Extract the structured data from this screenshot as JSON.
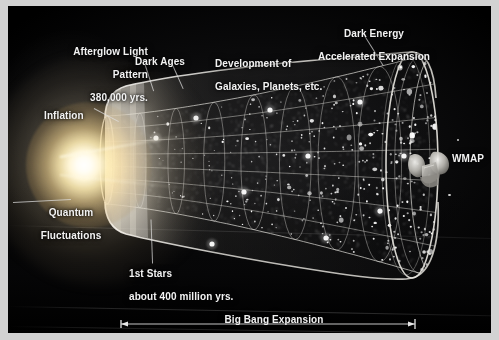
{
  "figure": {
    "kind": "cosmic-timeline-diagram",
    "background_color": "#000000",
    "frame_color": "#d2d2d2",
    "text_color": "#f2f2f2"
  },
  "annotations": {
    "afterglow": {
      "line1": "Afterglow Light",
      "line2": "Pattern",
      "line3": "380,000 yrs."
    },
    "dark_ages": {
      "label": "Dark Ages"
    },
    "development": {
      "line1": "Development of",
      "line2": "Galaxies, Planets, etc."
    },
    "dark_energy": {
      "line1": "Dark Energy",
      "line2": "Accelerated Expansion"
    },
    "inflation": {
      "label": "Inflation"
    },
    "quantum": {
      "line1": "Quantum",
      "line2": "Fluctuations"
    },
    "first_stars": {
      "line1": "1st Stars",
      "line2": "about 400 million yrs."
    },
    "wmap": {
      "label": "WMAP"
    }
  },
  "scale_bar": {
    "title": "Big Bang Expansion",
    "value": "13.7 billion years"
  },
  "chart_data": {
    "type": "diagram-timeline",
    "title": "Big Bang Expansion",
    "total_duration": "13.7 billion years",
    "epochs": [
      {
        "name": "Quantum Fluctuations",
        "time": ""
      },
      {
        "name": "Inflation",
        "time": ""
      },
      {
        "name": "Afterglow Light Pattern",
        "time": "380,000 yrs."
      },
      {
        "name": "Dark Ages",
        "time": ""
      },
      {
        "name": "1st Stars",
        "time": "about 400 million yrs."
      },
      {
        "name": "Development of Galaxies, Planets, etc.",
        "time": ""
      },
      {
        "name": "Dark Energy Accelerated Expansion",
        "time": ""
      }
    ],
    "observer": "WMAP"
  }
}
